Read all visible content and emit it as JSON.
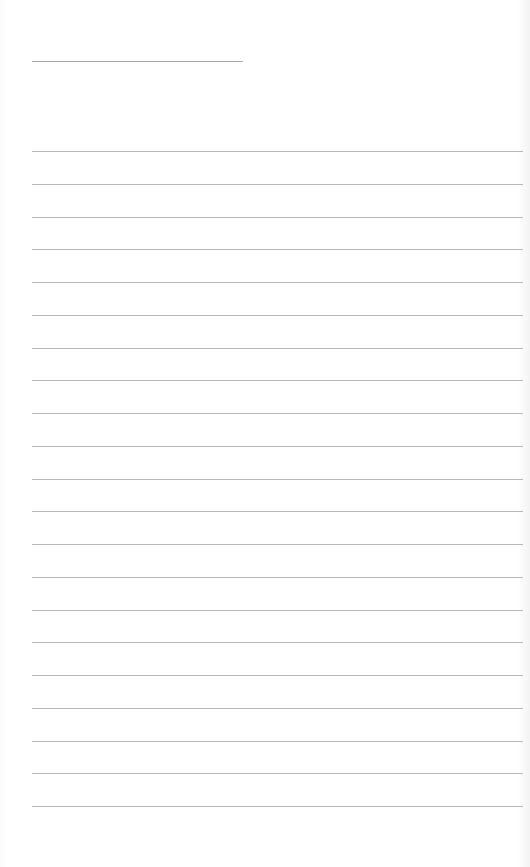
{
  "page": {
    "type": "lined-paper",
    "title_text": "",
    "background_color": "#ffffff",
    "rule_color": "#b8b8b8",
    "title_line": {
      "left": 32,
      "top": 61,
      "width": 211
    },
    "rules": {
      "left": 32,
      "width": 491,
      "first_top": 151,
      "spacing": 32.75,
      "count": 21
    },
    "lines_text": []
  }
}
